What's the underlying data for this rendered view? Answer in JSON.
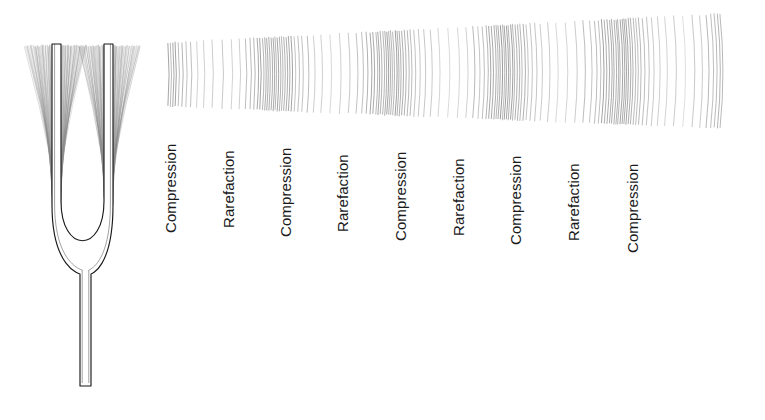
{
  "figure": {
    "width": 765,
    "height": 420,
    "background_color": "#ffffff"
  },
  "tuning_fork": {
    "name": "tuning-fork",
    "stroke_color": "#1a1a1a",
    "blur_color": "#8a8a8a",
    "prong_left": {
      "x": 52,
      "top_y": 44,
      "width": 9
    },
    "prong_right": {
      "x": 104,
      "top_y": 44,
      "width": 9
    },
    "stem": {
      "x": 80,
      "bottom_y": 386,
      "width": 11
    },
    "vibration_blur": "motion-blur-arcs"
  },
  "wave_field": {
    "name": "sound-wave-field",
    "line_color": "#6b6b6b",
    "left_x": 168,
    "right_x": 722,
    "top_left_y": 43,
    "top_right_y": 14,
    "bottom_left_y": 106,
    "bottom_right_y": 128,
    "bands": 9,
    "band_spacing_px": 57.5,
    "line_count": 460
  },
  "labels": [
    {
      "text": "Compression",
      "x": 178,
      "y": 218,
      "band": "compression"
    },
    {
      "text": "Rarefaction",
      "x": 236,
      "y": 213,
      "band": "rarefaction"
    },
    {
      "text": "Compression",
      "x": 293,
      "y": 222,
      "band": "compression"
    },
    {
      "text": "Rarefaction",
      "x": 350,
      "y": 217,
      "band": "rarefaction"
    },
    {
      "text": "Compression",
      "x": 408,
      "y": 226,
      "band": "compression"
    },
    {
      "text": "Rarefaction",
      "x": 466,
      "y": 221,
      "band": "rarefaction"
    },
    {
      "text": "Compression",
      "x": 523,
      "y": 230,
      "band": "compression"
    },
    {
      "text": "Rarefaction",
      "x": 581,
      "y": 226,
      "band": "rarefaction"
    },
    {
      "text": "Compression",
      "x": 640,
      "y": 238,
      "band": "compression"
    }
  ],
  "chart_data": {
    "type": "line",
    "xlabel": "",
    "ylabel": "",
    "categories": [
      "Compression",
      "Rarefaction",
      "Compression",
      "Rarefaction",
      "Compression",
      "Rarefaction",
      "Compression",
      "Rarefaction",
      "Compression"
    ],
    "x": [
      178,
      236,
      293,
      350,
      408,
      466,
      523,
      581,
      640
    ],
    "values": [
      1,
      -1,
      1,
      -1,
      1,
      -1,
      1,
      -1,
      1
    ],
    "series": [
      {
        "name": "Air density",
        "values": [
          1,
          -1,
          1,
          -1,
          1,
          -1,
          1,
          -1,
          1
        ]
      }
    ],
    "grid": false,
    "legend": "none"
  }
}
